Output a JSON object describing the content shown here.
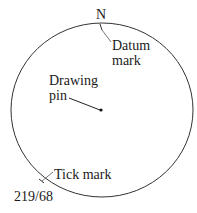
{
  "diagram": {
    "type": "compass-disc-bearing-diagram",
    "circle": {
      "cx": 102,
      "cy": 110,
      "rx": 91,
      "ry": 87,
      "stroke": "#333333"
    },
    "north_label": "N",
    "datum_mark": {
      "line1": "Datum",
      "line2": "mark"
    },
    "drawing_pin": {
      "line1": "Drawing",
      "line2": "pin"
    },
    "tick_mark": {
      "label": "Tick mark"
    },
    "bearing_label": "219/68",
    "colors": {
      "line": "#333333",
      "text": "#1a1a1a",
      "background": "#ffffff"
    }
  }
}
